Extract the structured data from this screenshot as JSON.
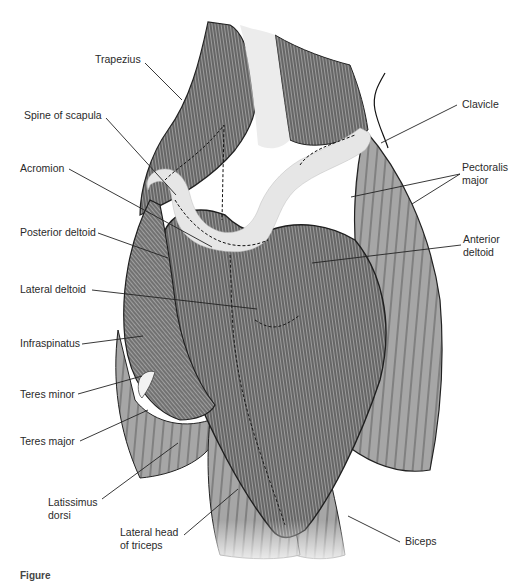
{
  "figure": {
    "colors": {
      "muscle_fill": "#a6a6a6",
      "muscle_dark": "#7a7a7a",
      "fiber_line": "#2b2b2b",
      "bone_fill": "#e6e6e6",
      "label_text": "#2a2a2a",
      "leader_line": "#222222",
      "background": "#ffffff"
    },
    "labels": [
      {
        "id": "trapezius",
        "text": "Trapezius"
      },
      {
        "id": "spine-of-scapula",
        "text": "Spine of scapula"
      },
      {
        "id": "acromion",
        "text": "Acromion"
      },
      {
        "id": "posterior-deltoid",
        "text": "Posterior deltoid"
      },
      {
        "id": "lateral-deltoid",
        "text": "Lateral deltoid"
      },
      {
        "id": "infraspinatus",
        "text": "Infraspinatus"
      },
      {
        "id": "teres-minor",
        "text": "Teres minor"
      },
      {
        "id": "teres-major",
        "text": "Teres major"
      },
      {
        "id": "latissimus-dorsi",
        "text": "Latissimus dorsi"
      },
      {
        "id": "lateral-head-of-triceps",
        "text": "Lateral head of triceps"
      },
      {
        "id": "biceps",
        "text": "Biceps"
      },
      {
        "id": "anterior-deltoid",
        "text": "Anterior deltoid"
      },
      {
        "id": "pectoralis-major",
        "text": "Pectoralis major"
      },
      {
        "id": "clavicle",
        "text": "Clavicle"
      }
    ],
    "caption": "Figure"
  }
}
